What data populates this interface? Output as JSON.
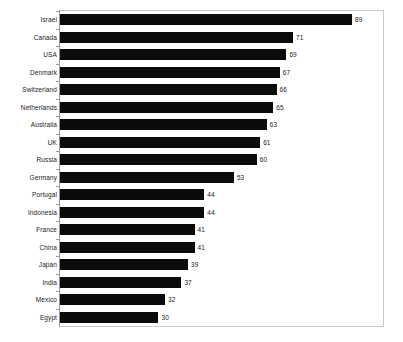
{
  "chart": {
    "background_color": "#ffffff",
    "bar_color": "#0b0b0b",
    "frame_color": "#c8c8c8",
    "axis_color": "#9a9a9a",
    "label_color": "#1a1a1a"
  },
  "chart_data": {
    "type": "bar",
    "orientation": "horizontal",
    "title": "",
    "subtitle": "",
    "xlabel": "",
    "ylabel": "",
    "grid": false,
    "legend": false,
    "xlim": [
      0,
      99
    ],
    "value_labels_shown": true,
    "categories": [
      "Israel",
      "Canada",
      "USA",
      "Denmark",
      "Switzerland",
      "Netherlands",
      "Australia",
      "UK",
      "Russia",
      "Germany",
      "Portugal",
      "Indonesia",
      "France",
      "China",
      "Japan",
      "India",
      "Mexico",
      "Egypt"
    ],
    "values": [
      89,
      71,
      69,
      67,
      66,
      65,
      63,
      61,
      60,
      53,
      44,
      44,
      41,
      41,
      39,
      37,
      32,
      30
    ],
    "value_text": [
      "89",
      "71",
      "69",
      "67",
      "66",
      "65",
      "63",
      "61",
      "60",
      "53",
      "44",
      "44",
      "41",
      "41",
      "39",
      "37",
      "32",
      "30"
    ]
  }
}
